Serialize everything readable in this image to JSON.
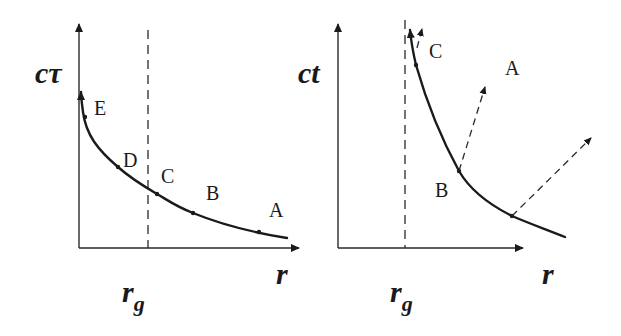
{
  "figure": {
    "left_panel": {
      "y_axis_label": "cτ",
      "x_axis_label": "r",
      "marker_label_main": "r",
      "marker_label_sub": "g",
      "point_labels": [
        "E",
        "D",
        "C",
        "B",
        "A"
      ]
    },
    "right_panel": {
      "y_axis_label": "ct",
      "x_axis_label": "r",
      "marker_label_main": "r",
      "marker_label_sub": "g",
      "point_labels": [
        "C",
        "A",
        "B"
      ]
    }
  },
  "colors": {
    "background": "#ffffff",
    "ink": "#1a1a1a"
  }
}
